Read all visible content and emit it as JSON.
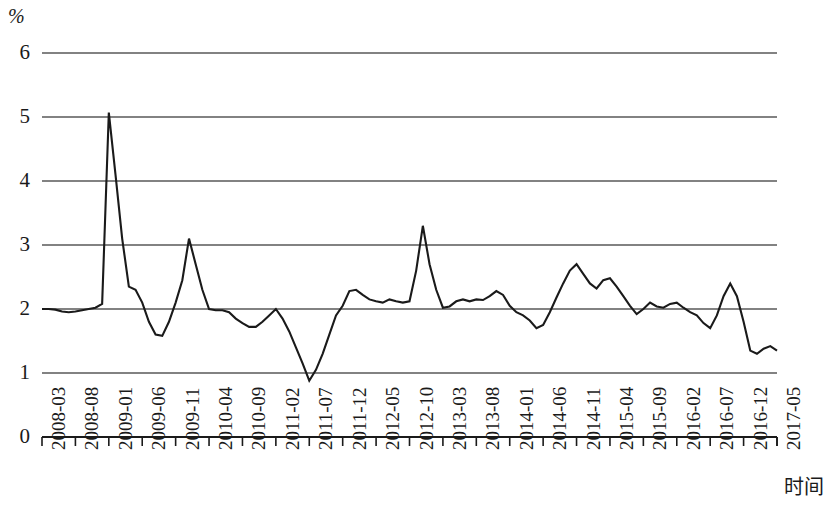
{
  "chart_data": {
    "type": "line",
    "title": "",
    "subtitle": "",
    "unit_label": "%",
    "xlabel": "时间",
    "ylabel": "",
    "ylim": [
      0,
      6
    ],
    "ytick_labels": [
      "0",
      "1",
      "2",
      "3",
      "4",
      "5",
      "6"
    ],
    "ytick_values": [
      0,
      1,
      2,
      3,
      4,
      5,
      6
    ],
    "grid": true,
    "grid_axis": "y",
    "legend": false,
    "legend_position": "none",
    "line_color": "#1a1a1a",
    "grid_color": "#595959",
    "axis_color": "#1a1a1a",
    "x_tick_labels": [
      "2008-03",
      "2008-08",
      "2009-01",
      "2009-06",
      "2009-11",
      "2010-04",
      "2010-09",
      "2011-02",
      "2011-07",
      "2011-12",
      "2012-05",
      "2012-10",
      "2013-03",
      "2013-08",
      "2014-01",
      "2014-06",
      "2014-11",
      "2015-04",
      "2015-09",
      "2016-02",
      "2016-07",
      "2016-12",
      "2017-05"
    ],
    "x_tick_interval_months": 5,
    "x_start": "2008-03",
    "x_end": "2017-05",
    "x": [
      "2008-03",
      "2008-04",
      "2008-05",
      "2008-06",
      "2008-07",
      "2008-08",
      "2008-09",
      "2008-10",
      "2008-11",
      "2008-12",
      "2009-01",
      "2009-02",
      "2009-03",
      "2009-04",
      "2009-05",
      "2009-06",
      "2009-07",
      "2009-08",
      "2009-09",
      "2009-10",
      "2009-11",
      "2009-12",
      "2010-01",
      "2010-02",
      "2010-03",
      "2010-04",
      "2010-05",
      "2010-06",
      "2010-07",
      "2010-08",
      "2010-09",
      "2010-10",
      "2010-11",
      "2010-12",
      "2011-01",
      "2011-02",
      "2011-03",
      "2011-04",
      "2011-05",
      "2011-06",
      "2011-07",
      "2011-08",
      "2011-09",
      "2011-10",
      "2011-11",
      "2011-12",
      "2012-01",
      "2012-02",
      "2012-03",
      "2012-04",
      "2012-05",
      "2012-06",
      "2012-07",
      "2012-08",
      "2012-09",
      "2012-10",
      "2012-11",
      "2012-12",
      "2013-01",
      "2013-02",
      "2013-03",
      "2013-04",
      "2013-05",
      "2013-06",
      "2013-07",
      "2013-08",
      "2013-09",
      "2013-10",
      "2013-11",
      "2013-12",
      "2014-01",
      "2014-02",
      "2014-03",
      "2014-04",
      "2014-05",
      "2014-06",
      "2014-07",
      "2014-08",
      "2014-09",
      "2014-10",
      "2014-11",
      "2014-12",
      "2015-01",
      "2015-02",
      "2015-03",
      "2015-04",
      "2015-05",
      "2015-06",
      "2015-07",
      "2015-08",
      "2015-09",
      "2015-10",
      "2015-11",
      "2015-12",
      "2016-01",
      "2016-02",
      "2016-03",
      "2016-04",
      "2016-05",
      "2016-06",
      "2016-07",
      "2016-08",
      "2016-09",
      "2016-10",
      "2016-11",
      "2016-12",
      "2017-01",
      "2017-02",
      "2017-03",
      "2017-04",
      "2017-05"
    ],
    "values": [
      2.0,
      2.0,
      1.99,
      1.96,
      1.95,
      1.96,
      1.98,
      2.0,
      2.02,
      2.08,
      5.07,
      4.1,
      3.1,
      2.35,
      2.3,
      2.1,
      1.8,
      1.6,
      1.58,
      1.8,
      2.1,
      2.45,
      3.1,
      2.7,
      2.3,
      2.0,
      1.98,
      1.98,
      1.95,
      1.85,
      1.78,
      1.72,
      1.72,
      1.8,
      1.9,
      2.0,
      1.85,
      1.65,
      1.4,
      1.15,
      0.88,
      1.05,
      1.3,
      1.6,
      1.9,
      2.05,
      2.28,
      2.3,
      2.22,
      2.15,
      2.12,
      2.1,
      2.15,
      2.12,
      2.1,
      2.12,
      2.6,
      3.3,
      2.7,
      2.3,
      2.02,
      2.04,
      2.12,
      2.15,
      2.12,
      2.15,
      2.14,
      2.2,
      2.28,
      2.22,
      2.05,
      1.95,
      1.9,
      1.82,
      1.7,
      1.75,
      1.95,
      2.18,
      2.4,
      2.6,
      2.7,
      2.55,
      2.4,
      2.32,
      2.45,
      2.48,
      2.35,
      2.2,
      2.05,
      1.92,
      2.0,
      2.1,
      2.04,
      2.02,
      2.08,
      2.1,
      2.02,
      1.95,
      1.9,
      1.78,
      1.7,
      1.9,
      2.2,
      2.4,
      2.2,
      1.8,
      1.35,
      1.3,
      1.38,
      1.42,
      1.35
    ],
    "y_min_point": {
      "label": "2011-07",
      "value": 0.88
    },
    "y_max_point": {
      "label": "2009-01",
      "value": 5.07
    }
  }
}
